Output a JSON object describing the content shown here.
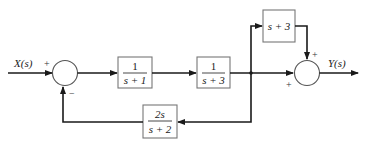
{
  "diagram": {
    "input_label": "X(s)",
    "output_label": "Y(s)",
    "junction1": {
      "plus_sign": "+",
      "minus_sign": "−"
    },
    "junction2": {
      "top_sign": "+",
      "left_sign": "+"
    },
    "blocks": [
      {
        "id": "G1",
        "numerator": "1",
        "denominator": "s + 1"
      },
      {
        "id": "G2",
        "numerator": "1",
        "denominator": "s + 3"
      },
      {
        "id": "G3",
        "expression": "s + 3"
      },
      {
        "id": "H",
        "numerator": "2s",
        "denominator": "s + 2"
      }
    ]
  }
}
